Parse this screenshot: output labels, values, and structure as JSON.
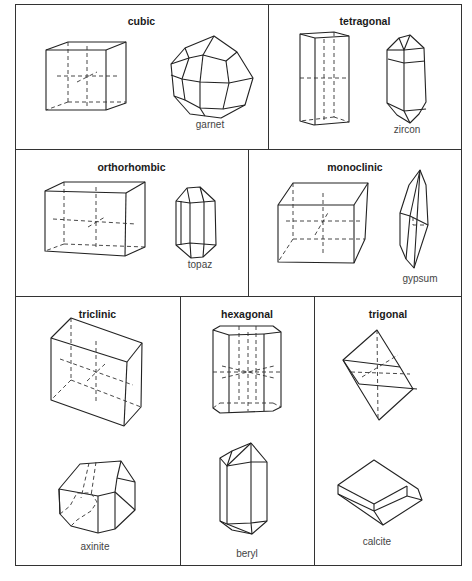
{
  "figure": {
    "type": "crystal-systems-diagram",
    "systems": [
      {
        "name": "cubic",
        "example": "garnet"
      },
      {
        "name": "tetragonal",
        "example": "zircon"
      },
      {
        "name": "orthorhombic",
        "example": "topaz"
      },
      {
        "name": "monoclinic",
        "example": "gypsum"
      },
      {
        "name": "triclinic",
        "example": "axinite"
      },
      {
        "name": "hexagonal",
        "example": "beryl"
      },
      {
        "name": "trigonal",
        "example": "calcite"
      }
    ]
  },
  "colors": {
    "line": "#222222",
    "background": "#ffffff",
    "label": "#444444"
  }
}
